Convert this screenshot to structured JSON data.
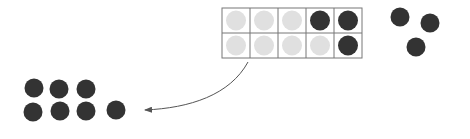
{
  "diagram": {
    "colors": {
      "filled": "#333333",
      "empty": "#e0e0e0",
      "grid": "#777777",
      "arrow": "#555555"
    },
    "ten_frame": {
      "rows": 2,
      "cols": 5,
      "cells": [
        [
          "empty",
          "empty",
          "empty",
          "filled",
          "filled"
        ],
        [
          "empty",
          "empty",
          "empty",
          "empty",
          "filled"
        ]
      ]
    },
    "loose_counters": [
      {
        "x": 400,
        "y": 17
      },
      {
        "x": 430,
        "y": 23
      },
      {
        "x": 416,
        "y": 47
      }
    ],
    "result_group": [
      {
        "x": 34,
        "y": 88
      },
      {
        "x": 59,
        "y": 89
      },
      {
        "x": 86,
        "y": 89
      },
      {
        "x": 33,
        "y": 112
      },
      {
        "x": 60,
        "y": 111
      },
      {
        "x": 86,
        "y": 111
      },
      {
        "x": 116,
        "y": 110
      }
    ]
  }
}
